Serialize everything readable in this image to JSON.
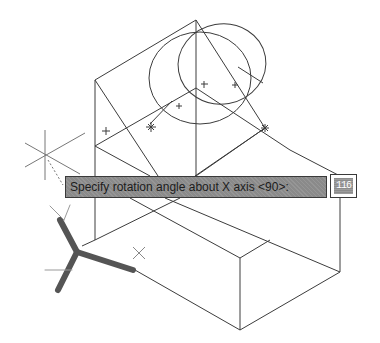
{
  "viewport": {
    "background": "#ffffff",
    "line_color": "#3c3c3c",
    "ucs_icon_color": "#555555"
  },
  "dynamic_input": {
    "prompt": "Specify rotation angle about X axis <90>:",
    "value": "116",
    "prompt_bg": "#8a8a8a"
  },
  "crosshair": {
    "x": 45,
    "y": 155
  },
  "icons": {
    "ucs": "ucs-icon",
    "crosshair": "crosshair-cursor-icon"
  }
}
